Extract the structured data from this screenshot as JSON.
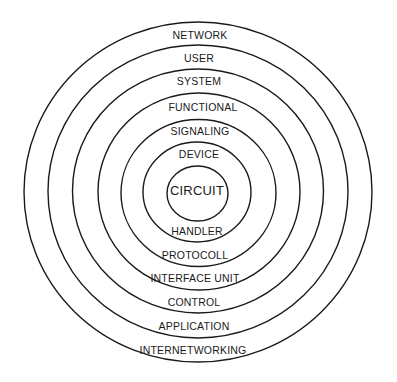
{
  "diagram": {
    "type": "concentric-layers",
    "colors": {
      "background": "#ffffff",
      "stroke": "#1a1a1a",
      "text": "#1a1a1a"
    },
    "rings": [
      {
        "name": "ring-1-outer",
        "cx": 198,
        "cy": 192,
        "rx": 174,
        "ry": 170
      },
      {
        "name": "ring-2",
        "cx": 198,
        "cy": 191.5,
        "rx": 150,
        "ry": 146.5
      },
      {
        "name": "ring-3",
        "cx": 198,
        "cy": 191,
        "rx": 125.5,
        "ry": 122
      },
      {
        "name": "ring-4",
        "cx": 199,
        "cy": 191.5,
        "rx": 101,
        "ry": 98.5
      },
      {
        "name": "ring-5",
        "cx": 198.5,
        "cy": 193,
        "rx": 77.5,
        "ry": 73.5
      },
      {
        "name": "ring-6",
        "cx": 197,
        "cy": 192,
        "rx": 54,
        "ry": 50
      },
      {
        "name": "ring-7-inner",
        "cx": 197.5,
        "cy": 193.5,
        "rx": 30.5,
        "ry": 27.5
      }
    ],
    "labels": [
      {
        "name": "label-network",
        "text": "NETWORK",
        "x": 200,
        "y": 35,
        "center": false
      },
      {
        "name": "label-user",
        "text": "USER",
        "x": 199,
        "y": 58,
        "center": false
      },
      {
        "name": "label-system",
        "text": "SYSTEM",
        "x": 199,
        "y": 81,
        "center": false
      },
      {
        "name": "label-functional",
        "text": "FUNCTIONAL",
        "x": 203,
        "y": 107,
        "center": false
      },
      {
        "name": "label-signaling",
        "text": "SIGNALING",
        "x": 200,
        "y": 131,
        "center": false
      },
      {
        "name": "label-device",
        "text": "DEVICE",
        "x": 199,
        "y": 154,
        "center": false
      },
      {
        "name": "label-circuit",
        "text": "CIRCUIT",
        "x": 197,
        "y": 190,
        "center": true
      },
      {
        "name": "label-handler",
        "text": "HANDLER",
        "x": 197,
        "y": 231,
        "center": false
      },
      {
        "name": "label-protocoll",
        "text": "PROTOCOLL",
        "x": 195,
        "y": 255,
        "center": false
      },
      {
        "name": "label-interface-unit",
        "text": "INTERFACE UNIT",
        "x": 195,
        "y": 278,
        "center": false
      },
      {
        "name": "label-control",
        "text": "CONTROL",
        "x": 194,
        "y": 302,
        "center": false
      },
      {
        "name": "label-application",
        "text": "APPLICATION",
        "x": 194,
        "y": 326,
        "center": false
      },
      {
        "name": "label-internetworking",
        "text": "INTERNETWORKING",
        "x": 193,
        "y": 350,
        "center": false
      }
    ]
  }
}
